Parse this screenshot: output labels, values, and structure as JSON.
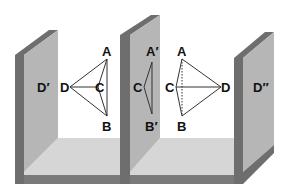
{
  "figure": {
    "colors": {
      "wall_face": "#b4b4b4",
      "wall_edge": "#6e6e6e",
      "floor": "#d4d4d4",
      "floor_edge": "#7a7a7a",
      "line": "#333333",
      "background": "#ffffff"
    },
    "left_wall": {
      "label": "D′"
    },
    "left_tetrahedron": {
      "labels": {
        "A": "A",
        "B": "B",
        "C": "C",
        "D": "D"
      }
    },
    "middle_wall": {
      "projection_labels": {
        "A": "A′",
        "B": "B′",
        "C": "C"
      }
    },
    "right_tetrahedron": {
      "labels": {
        "A": "A",
        "B": "B",
        "C": "C",
        "D": "D"
      }
    },
    "right_wall": {
      "label": "D″"
    }
  }
}
